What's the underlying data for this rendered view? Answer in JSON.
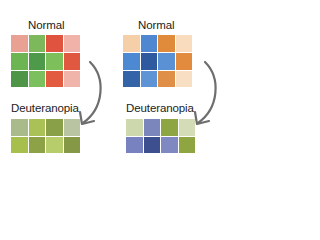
{
  "panels": [
    {
      "id": "red-green",
      "normal": {
        "label": "Normal",
        "cells": [
          [
            "#e9a193",
            "#7db85c",
            "#e0533f",
            "#f1b3a9"
          ],
          [
            "#6db552",
            "#4f9a4a",
            "#7dbf5b",
            "#e0583f"
          ],
          [
            "#4f9547",
            "#7bbf5f",
            "#e25a40",
            "#f1b4aa"
          ]
        ]
      },
      "deuteranopia": {
        "label": "Deuteranopia",
        "cells": [
          [
            "#a9ba8b",
            "#a9c157",
            "#8aa048",
            "#b9c5a2"
          ],
          [
            "#a7c04d",
            "#8da246",
            "#b7cc6a",
            "#849846"
          ]
        ]
      }
    },
    {
      "id": "blue-orange",
      "normal": {
        "label": "Normal",
        "cells": [
          [
            "#f4cfa8",
            "#4f87d0",
            "#e08a3c",
            "#f8dcbd"
          ],
          [
            "#4d88d3",
            "#2f5a9f",
            "#5a90d4",
            "#e28a3e"
          ],
          [
            "#3563a8",
            "#5e93d6",
            "#e08f48",
            "#f8dfc3"
          ]
        ]
      },
      "deuteranopia": {
        "label": "Deuteranopia",
        "cells": [
          [
            "#cdd8ad",
            "#7b86bd",
            "#8ea544",
            "#d3dcb6"
          ],
          [
            "#7882c0",
            "#3d4f8e",
            "#8088c2",
            "#8fa542"
          ]
        ]
      }
    }
  ],
  "arrow_color": "#6e6e6e",
  "label_text": {
    "left_normal": "Normal",
    "left_deut": "Deuteranopia",
    "right_normal": "Normal",
    "right_deut": "Deuteranopia"
  }
}
